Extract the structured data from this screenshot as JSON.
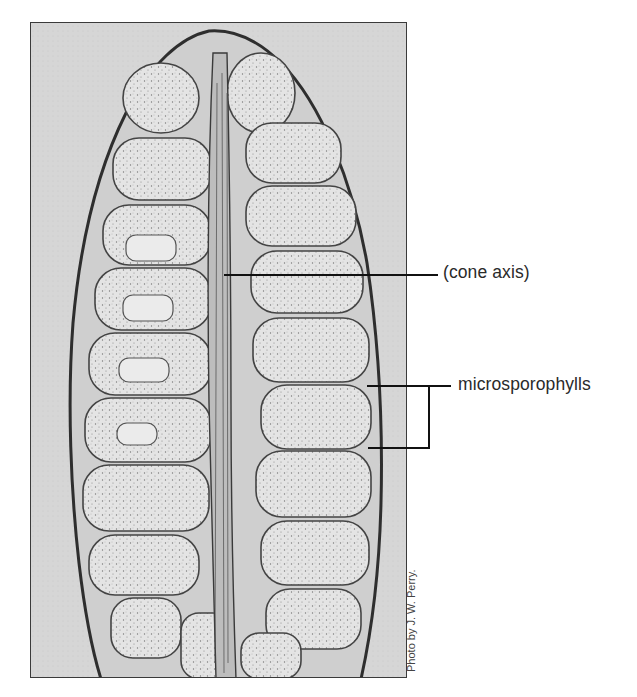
{
  "figure": {
    "labels": [
      {
        "id": "cone-axis",
        "text": "(cone axis)"
      },
      {
        "id": "microsporophylls",
        "text": "microsporophylls"
      }
    ],
    "credit": "Photo by J. W. Perry.",
    "colors": {
      "background": "#d9d9d9",
      "tissue": "#e6e6e6",
      "stain": "#3a3a3a",
      "leader_line": "#111111",
      "label_text": "#2a2a2a"
    }
  }
}
